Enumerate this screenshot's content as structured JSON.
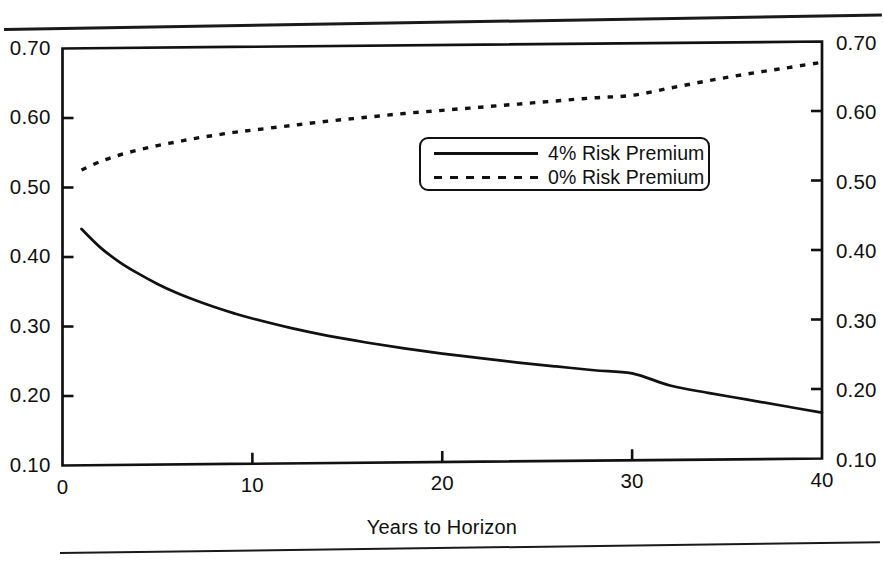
{
  "figure": {
    "rule_top": "horizontal-rule",
    "rule_bottom": "horizontal-rule"
  },
  "chart_data": {
    "type": "line",
    "title": "",
    "xlabel": "Years to Horizon",
    "ylabel": "",
    "xlim": [
      0,
      40
    ],
    "ylim": [
      0.1,
      0.7
    ],
    "xticks": [
      0,
      10,
      20,
      30,
      40
    ],
    "xtick_labels": [
      "0",
      "10",
      "20",
      "30",
      "40"
    ],
    "yticks": [
      0.1,
      0.2,
      0.3,
      0.4,
      0.5,
      0.6,
      0.7
    ],
    "ytick_labels": [
      "0.10",
      "0.20",
      "0.30",
      "0.40",
      "0.50",
      "0.60",
      "0.70"
    ],
    "ytick_labels_right": [
      "0.10",
      "0.20",
      "0.30",
      "0.40",
      "0.50",
      "0.60",
      "0.70"
    ],
    "right_axis": true,
    "grid": false,
    "legend_position": "upper-center-right",
    "line_color": "#111111",
    "x": [
      1,
      2,
      3,
      4,
      5,
      6,
      7,
      8,
      9,
      10,
      12,
      14,
      16,
      18,
      20,
      22,
      24,
      26,
      28,
      30,
      32,
      34,
      36,
      38,
      40
    ],
    "series": [
      {
        "name": "4% Risk Premium",
        "style": "solid",
        "values": [
          0.44,
          0.413,
          0.392,
          0.375,
          0.36,
          0.347,
          0.336,
          0.326,
          0.317,
          0.309,
          0.295,
          0.283,
          0.273,
          0.264,
          0.256,
          0.249,
          0.242,
          0.236,
          0.23,
          0.225,
          0.207,
          0.196,
          0.186,
          0.176,
          0.166
        ]
      },
      {
        "name": "0% Risk Premium",
        "style": "dashed",
        "values": [
          0.525,
          0.537,
          0.546,
          0.553,
          0.559,
          0.564,
          0.569,
          0.573,
          0.577,
          0.58,
          0.586,
          0.592,
          0.597,
          0.602,
          0.606,
          0.61,
          0.614,
          0.618,
          0.622,
          0.625,
          0.635,
          0.645,
          0.654,
          0.662,
          0.67
        ]
      }
    ]
  },
  "legend": {
    "items": [
      {
        "label": "4% Risk Premium",
        "style": "solid"
      },
      {
        "label": "0% Risk Premium",
        "style": "dashed"
      }
    ]
  }
}
